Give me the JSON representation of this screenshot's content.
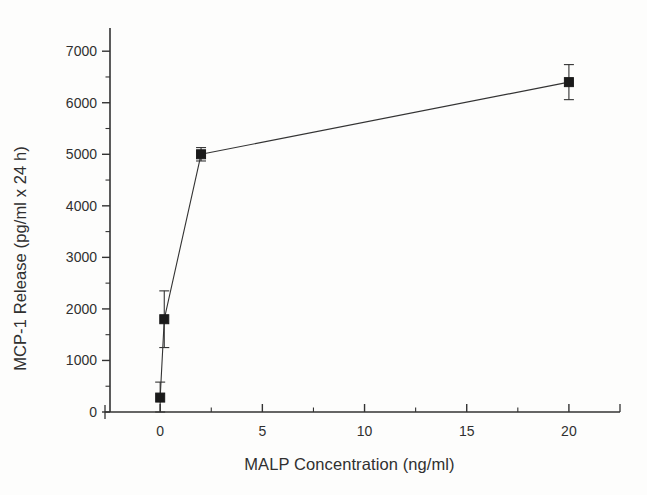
{
  "figure": {
    "background_color": "#fdfdfc",
    "ink_color": "#333333",
    "marker_color": "#1a1a1a"
  },
  "chart_data": {
    "type": "line",
    "title": "",
    "subtitle": "",
    "xlabel": "MALP Concentration (ng/ml)",
    "ylabel": "MCP-1 Release (pg/ml x 24 h)",
    "xlim": [
      -2.7,
      22.5
    ],
    "ylim": [
      0,
      7450
    ],
    "grid": false,
    "legend": "none",
    "x_ticks": [
      0,
      5,
      10,
      15,
      20
    ],
    "x_tick_labels": [
      "0",
      "5",
      "10",
      "15",
      "20"
    ],
    "x_minor_ticks": [
      2.5,
      7.5,
      12.5,
      17.5
    ],
    "y_ticks": [
      0,
      1000,
      2000,
      3000,
      4000,
      5000,
      6000,
      7000
    ],
    "y_tick_labels": [
      "0",
      "1000",
      "2000",
      "3000",
      "4000",
      "5000",
      "6000",
      "7000"
    ],
    "y_minor_ticks": [
      500,
      1500,
      2500,
      3500,
      4500,
      5500,
      6500
    ],
    "series": [
      {
        "name": "MCP-1 release",
        "marker": "filled-square",
        "x": [
          0,
          0.2,
          2,
          20
        ],
        "values": [
          280,
          1800,
          5000,
          6400
        ],
        "yerr": [
          300,
          550,
          130,
          340
        ]
      }
    ]
  }
}
